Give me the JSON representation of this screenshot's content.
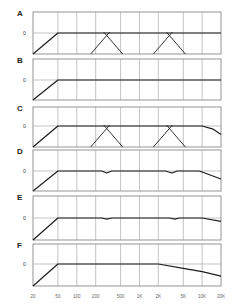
{
  "chart_data": {
    "type": "line",
    "title": "",
    "xlabel": "",
    "ylabel": "",
    "x_scale": "log",
    "x_tick_labels": [
      "20",
      "50",
      "100",
      "200",
      "500",
      "1K",
      "2K",
      "5K",
      "10K",
      "20K"
    ],
    "x_tick_values": [
      20,
      50,
      100,
      200,
      500,
      1000,
      2000,
      5000,
      10000,
      20000
    ],
    "xlim": [
      20,
      20000
    ],
    "y_reference_label": "0",
    "grid": true,
    "legend": null,
    "panels": [
      {
        "label": "A",
        "description": "High-pass at 50 Hz, flat, with two crossover X points near 300 Hz and 3K",
        "series": [
          {
            "name": "main",
            "x": [
              20,
              50,
              20000
            ],
            "y": [
              -1,
              0,
              0
            ]
          },
          {
            "name": "crossover-1-lp",
            "x": [
              200,
              300,
              650
            ],
            "y": [
              -1,
              0,
              0
            ],
            "shape": "X-left"
          },
          {
            "name": "crossover-1-hp",
            "x": [
              200,
              300,
              650
            ],
            "y": [
              0,
              0,
              -1
            ],
            "shape": "X-right"
          },
          {
            "name": "crossover-2-lp",
            "x": [
              1800,
              3000,
              6500
            ],
            "y": [
              -1,
              0,
              0
            ],
            "shape": "X-left"
          },
          {
            "name": "crossover-2-hp",
            "x": [
              1800,
              3000,
              6500
            ],
            "y": [
              0,
              0,
              -1
            ],
            "shape": "X-right"
          }
        ]
      },
      {
        "label": "B",
        "description": "High-pass at 50 Hz then flat to 20K",
        "series": [
          {
            "name": "main",
            "x": [
              20,
              50,
              20000
            ],
            "y": [
              -1,
              0,
              0
            ]
          }
        ]
      },
      {
        "label": "C",
        "description": "Same as A with high-frequency rolloff above ~10K",
        "series": [
          {
            "name": "main",
            "x": [
              20,
              50,
              10000,
              15000,
              20000
            ],
            "y": [
              -1,
              0,
              0,
              -0.15,
              -0.4
            ]
          },
          {
            "name": "crossover-1-lp",
            "x": [
              200,
              300,
              650
            ],
            "y": [
              -1,
              0,
              0
            ],
            "shape": "X-left"
          },
          {
            "name": "crossover-1-hp",
            "x": [
              200,
              300,
              650
            ],
            "y": [
              0,
              0,
              -1
            ],
            "shape": "X-right"
          },
          {
            "name": "crossover-2-lp",
            "x": [
              1800,
              3000,
              6500
            ],
            "y": [
              -1,
              0,
              0
            ],
            "shape": "X-left"
          },
          {
            "name": "crossover-2-hp",
            "x": [
              1800,
              3000,
              6500
            ],
            "y": [
              0,
              0,
              -1
            ],
            "shape": "X-right"
          }
        ]
      },
      {
        "label": "D",
        "description": "Summed response with small dips at crossovers and HF rolloff",
        "series": [
          {
            "name": "main",
            "x": [
              20,
              50,
              250,
              300,
              360,
              2600,
              3300,
              4000,
              9000,
              20000
            ],
            "y": [
              -1,
              0,
              0,
              -0.1,
              0,
              0,
              -0.1,
              0,
              0,
              -0.4
            ]
          }
        ]
      },
      {
        "label": "E",
        "description": "Summed response with very small dips and slight HF rolloff",
        "series": [
          {
            "name": "main",
            "x": [
              20,
              50,
              250,
              300,
              360,
              3000,
              3700,
              4300,
              10000,
              20000
            ],
            "y": [
              -1,
              0,
              0,
              -0.05,
              0,
              0,
              -0.05,
              0,
              0,
              -0.15
            ]
          }
        ]
      },
      {
        "label": "F",
        "description": "Flat summed response with gradual rolloff above ~2K",
        "series": [
          {
            "name": "main",
            "x": [
              20,
              50,
              2000,
              5000,
              10000,
              20000
            ],
            "y": [
              -1,
              0,
              0,
              -0.2,
              -0.35,
              -0.55
            ]
          }
        ]
      }
    ]
  },
  "layout": {
    "plot_left": 33,
    "plot_right": 221,
    "panels_px": [
      {
        "top": 12,
        "mid": 33,
        "bottom": 54
      },
      {
        "top": 59,
        "mid": 80,
        "bottom": 100
      },
      {
        "top": 107,
        "mid": 126,
        "bottom": 147
      },
      {
        "top": 150,
        "mid": 171,
        "bottom": 191
      },
      {
        "top": 196,
        "mid": 218,
        "bottom": 240
      },
      {
        "top": 244,
        "mid": 264,
        "bottom": 286
      }
    ],
    "tick_label_y": 298,
    "colors": {
      "frame": "#7a7a7a",
      "grid": "#9a9a9a",
      "curve": "#1e1e1e",
      "text": "#333333"
    }
  }
}
